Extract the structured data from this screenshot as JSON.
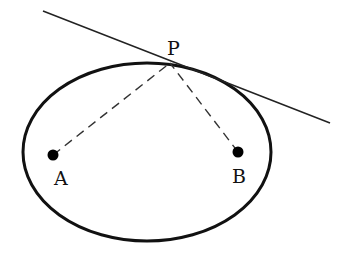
{
  "diagram": {
    "type": "ellipse-tangent-reflection",
    "colors": {
      "stroke": "#111111",
      "background": "#ffffff"
    },
    "ellipse": {
      "cx": 147,
      "cy": 152,
      "rx": 124,
      "ry": 89
    },
    "tangent_line": {
      "x1": 43,
      "y1": 11,
      "x2": 330,
      "y2": 123
    },
    "points": {
      "P": {
        "label": "P",
        "x": 170,
        "y": 63,
        "label_x": 167,
        "label_y": 55
      },
      "A": {
        "label": "A",
        "x": 53,
        "y": 155,
        "label_x": 54,
        "label_y": 185
      },
      "B": {
        "label": "B",
        "x": 238,
        "y": 152,
        "label_x": 232,
        "label_y": 183
      }
    },
    "dashed_segments": [
      {
        "from": "A",
        "to": "P"
      },
      {
        "from": "B",
        "to": "P"
      }
    ]
  }
}
